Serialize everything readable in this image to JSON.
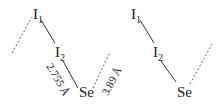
{
  "diagram": {
    "type": "molecular-chain",
    "units": [
      {
        "atoms": [
          {
            "id": "I1",
            "symbol": "I",
            "subscript": "1"
          },
          {
            "id": "I2",
            "symbol": "I",
            "subscript": "2"
          },
          {
            "id": "Se",
            "symbol": "Se",
            "subscript": ""
          }
        ]
      },
      {
        "atoms": [
          {
            "id": "I1",
            "symbol": "I",
            "subscript": "1"
          },
          {
            "id": "I2",
            "symbol": "I",
            "subscript": "2"
          },
          {
            "id": "Se",
            "symbol": "Se",
            "subscript": ""
          }
        ]
      }
    ],
    "labels": {
      "bond_distance": "2.755 Å",
      "contact_distance": "3.89 Å"
    },
    "legend": {
      "solid_line": "covalent bond",
      "dashed_line": "secondary contact"
    }
  }
}
